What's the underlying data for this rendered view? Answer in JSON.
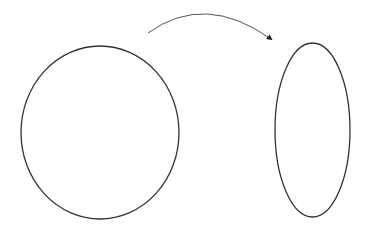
{
  "diagram": {
    "width": 368,
    "height": 231,
    "background": "#ffffff",
    "stroke_color": "#333333",
    "shapes": [
      {
        "id": "source-ellipse",
        "type": "ellipse",
        "cx": 100,
        "cy": 132.5,
        "rx": 79,
        "ry": 86.5
      },
      {
        "id": "target-ellipse",
        "type": "ellipse",
        "cx": 312.5,
        "cy": 130,
        "rx": 37.5,
        "ry": 87
      }
    ],
    "arrow": {
      "from": {
        "x": 148,
        "y": 33
      },
      "to": {
        "x": 271,
        "y": 39
      },
      "control": {
        "x": 205,
        "y": -8
      },
      "color": "#555555"
    }
  }
}
